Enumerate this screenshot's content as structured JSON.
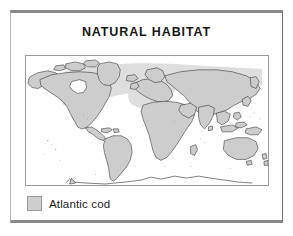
{
  "figure": {
    "title": "NATURAL HABITAT",
    "frame_top_color": "#8a8a8a",
    "frame_side_color": "#9a9a9a",
    "background_color": "#ffffff"
  },
  "map": {
    "name": "world-map",
    "projection": "world-equirectangular",
    "land_fill_color": "#cdcdcd",
    "land_stroke_color": "#2b2b2b",
    "ocean_fill_color": "#ffffff",
    "border_color": "#9a9a9a",
    "habitat_band": {
      "name": "atlantic-cod-range-band",
      "fill_color": "#dedede",
      "description": "north-atlantic-and-arctic-band"
    }
  },
  "legend": {
    "items": [
      {
        "label": "Atlantic cod",
        "swatch_color": "#cfcfcf",
        "swatch_border_color": "#9b9b9b"
      }
    ]
  }
}
